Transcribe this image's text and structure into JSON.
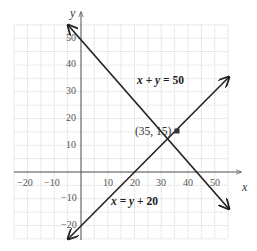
{
  "chart_data": {
    "type": "line",
    "title": "",
    "xlabel": "x",
    "ylabel": "y",
    "xlim": [
      -25,
      55
    ],
    "ylim": [
      -25,
      55
    ],
    "grid": true,
    "grid_step": 5,
    "x_ticks": [
      "-20",
      "-10",
      "10",
      "20",
      "30",
      "40",
      "50"
    ],
    "y_ticks": [
      "50",
      "40",
      "30",
      "20",
      "10",
      "-10",
      "-20"
    ],
    "series": [
      {
        "name": "x + y = 50",
        "equation": "x + y = 50",
        "x": [
          -5,
          55
        ],
        "y": [
          55,
          -5
        ]
      },
      {
        "name": "x = y + 20",
        "equation": "x = y + 20",
        "x": [
          -5,
          55
        ],
        "y": [
          -25,
          35
        ]
      }
    ],
    "annotations": [
      {
        "text": "(35, 15)",
        "x": 35,
        "y": 15,
        "type": "intersection-point"
      }
    ],
    "colors": {
      "grid": "#cfcfcf",
      "axis": "#555555",
      "line": "#222222"
    }
  },
  "labels": {
    "x_axis": "x",
    "y_axis": "y",
    "eq1_left": "x",
    "eq1_op": " + ",
    "eq1_mid": "y",
    "eq1_rest": " = 50",
    "eq2_left": "x",
    "eq2_eq": " = ",
    "eq2_mid": "y",
    "eq2_rest": " + 20",
    "point": "(35, 15)",
    "xt": [
      "−20",
      "−10",
      "10",
      "20",
      "30",
      "40",
      "50"
    ],
    "yt": [
      "50",
      "40",
      "30",
      "20",
      "10",
      "−10",
      "−20"
    ]
  }
}
